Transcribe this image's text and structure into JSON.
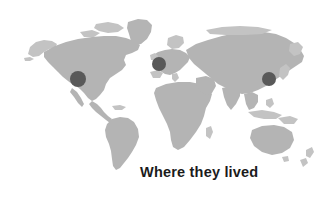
{
  "figure": {
    "width": 328,
    "height": 202,
    "background_color": "#ffffff",
    "caption": "Where they lived",
    "caption_color": "#1b1b1b"
  },
  "map": {
    "name": "world-map",
    "projection_style": "equirectangular-silhouette",
    "land_color": "#b4b4b4",
    "land_color_soft": "#c3c3c3",
    "ocean_color": "#ffffff",
    "continents": [
      "North America",
      "South America",
      "Greenland",
      "Europe",
      "Africa",
      "Asia",
      "Australia"
    ]
  },
  "markers": {
    "color": "#595959",
    "count": 3,
    "points": [
      {
        "id": "marker-north-america",
        "label": "Western North America",
        "x": 78,
        "y": 79,
        "r": 8
      },
      {
        "id": "marker-europe",
        "label": "Western Europe",
        "x": 159,
        "y": 64,
        "r": 7
      },
      {
        "id": "marker-east-asia",
        "label": "East Asia",
        "x": 269,
        "y": 79,
        "r": 7
      }
    ]
  }
}
